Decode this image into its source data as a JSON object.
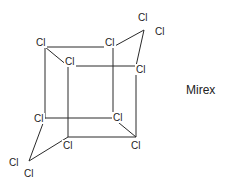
{
  "diagram": {
    "compound_name": "Mirex",
    "atom_label": "Cl",
    "bond_color": "#2a2a2a",
    "text_color": "#222222",
    "vertices": {
      "btl": [
        45,
        47
      ],
      "btr": [
        113,
        47
      ],
      "ftl": [
        68,
        66
      ],
      "ftr": [
        136,
        66
      ],
      "bbl": [
        45,
        118
      ],
      "bbr": [
        113,
        118
      ],
      "fbl": [
        68,
        137
      ],
      "fbr": [
        136,
        137
      ],
      "ctop": [
        144,
        30
      ],
      "cbot": [
        29,
        161
      ]
    },
    "bonds": [
      [
        "btl",
        "btr"
      ],
      [
        "btl",
        "ftl"
      ],
      [
        "btl",
        "bbl"
      ],
      [
        "btr",
        "bbr"
      ],
      [
        "btr",
        "ctop"
      ],
      [
        "ftl",
        "ftr"
      ],
      [
        "ftl",
        "fbl"
      ],
      [
        "ftr",
        "fbr"
      ],
      [
        "ftr",
        "ctop"
      ],
      [
        "bbl",
        "bbr"
      ],
      [
        "bbl",
        "cbot"
      ],
      [
        "bbr",
        "fbr"
      ],
      [
        "fbl",
        "fbr"
      ],
      [
        "fbl",
        "cbot"
      ]
    ],
    "labels": [
      {
        "text": "Cl",
        "x": 36,
        "y": 46
      },
      {
        "text": "Cl",
        "x": 105,
        "y": 46
      },
      {
        "text": "Cl",
        "x": 65,
        "y": 65
      },
      {
        "text": "Cl",
        "x": 136,
        "y": 73
      },
      {
        "text": "Cl",
        "x": 138,
        "y": 21
      },
      {
        "text": "Cl",
        "x": 155,
        "y": 35
      },
      {
        "text": "Cl",
        "x": 34,
        "y": 122
      },
      {
        "text": "Cl",
        "x": 113,
        "y": 121
      },
      {
        "text": "Cl",
        "x": 63,
        "y": 149
      },
      {
        "text": "Cl",
        "x": 131,
        "y": 149
      },
      {
        "text": "Cl",
        "x": 9,
        "y": 166
      },
      {
        "text": "Cl",
        "x": 24,
        "y": 177
      }
    ],
    "name_position": [
      186,
      94
    ]
  }
}
